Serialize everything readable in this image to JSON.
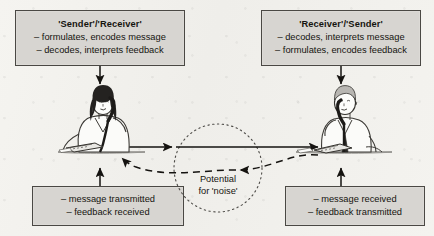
{
  "diagram": {
    "background_color": "#f3f2ee",
    "box_fill": "#d7d5d1",
    "box_border": "#4a4844",
    "ink": "#15140f"
  },
  "boxes": {
    "top_left": {
      "title": "'Sender'/'Receiver'",
      "lines": [
        "– formulates, encodes message",
        "– decodes, interprets feedback"
      ]
    },
    "top_right": {
      "title": "'Receiver'/'Sender'",
      "lines": [
        "– decodes, interprets message",
        "– formulates, encodes feedback"
      ]
    },
    "bottom_left": {
      "lines": [
        "– message transmitted",
        "– feedback received"
      ]
    },
    "bottom_right": {
      "lines": [
        "– message received",
        "– feedback transmitted"
      ]
    }
  },
  "center": {
    "label_line_1": "Potential",
    "label_line_2": "for 'noise'",
    "shape": "dotted-circle"
  },
  "flows": {
    "message": {
      "style": "solid",
      "direction": "left-to-right"
    },
    "feedback": {
      "style": "dashed",
      "direction": "right-to-left"
    }
  },
  "figures": {
    "left": {
      "name": "woman-on-telephone",
      "desc": "woman with dark hair seated at desk holding telephone handset"
    },
    "right": {
      "name": "man-on-telephone",
      "desc": "man seated at desk holding telephone handset"
    }
  },
  "connectors": {
    "top_left_to_figure": "down-arrow",
    "top_right_to_figure": "down-arrow",
    "bottom_left_to_figure": "up-arrow",
    "bottom_right_to_figure": "up-arrow"
  }
}
